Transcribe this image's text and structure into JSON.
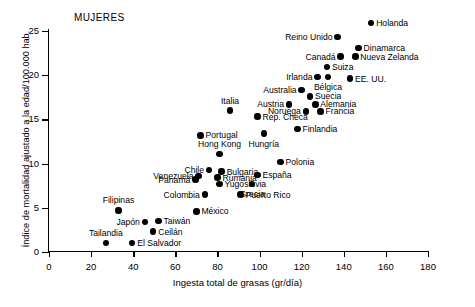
{
  "chart": {
    "title": "MUJERES",
    "xlabel": "Ingesta total de grasas (gr/día)",
    "ylabel": "Índice de mortalidad ajustado a la edad/100.000 hab."
  },
  "chart_data": {
    "type": "scatter",
    "title": "MUJERES",
    "xlabel": "Ingesta total de grasas (gr/día)",
    "ylabel": "Índice de mortalidad ajustado a la edad/100.000 hab.",
    "xlim": [
      0,
      180
    ],
    "ylim": [
      0,
      25
    ],
    "xticks": [
      0,
      20,
      40,
      60,
      80,
      100,
      120,
      140,
      160,
      180
    ],
    "yticks": [
      0,
      5,
      10,
      15,
      20,
      25
    ],
    "grid": false,
    "legend": null,
    "points": [
      {
        "label": "Holanda",
        "x": 153.0,
        "y": 25.9,
        "lpos": "r"
      },
      {
        "label": "Reino Unido",
        "x": 137.0,
        "y": 24.3,
        "lpos": "l"
      },
      {
        "label": "Dinamarca",
        "x": 147.0,
        "y": 23.1,
        "lpos": "r"
      },
      {
        "label": "Canadá",
        "x": 138.5,
        "y": 22.1,
        "lpos": "l"
      },
      {
        "label": "Nueva Zelanda",
        "x": 145.5,
        "y": 22.1,
        "lpos": "r"
      },
      {
        "label": "Suiza",
        "x": 132.0,
        "y": 20.9,
        "lpos": "r"
      },
      {
        "label": "Irlanda",
        "x": 127.5,
        "y": 19.8,
        "lpos": "l"
      },
      {
        "label": "Bélgica",
        "x": 132.5,
        "y": 19.8,
        "lpos": "b"
      },
      {
        "label": "EE. UU.",
        "x": 143.0,
        "y": 19.6,
        "lpos": "r"
      },
      {
        "label": "Australia",
        "x": 120.0,
        "y": 18.3,
        "lpos": "l"
      },
      {
        "label": "Suecia",
        "x": 124.0,
        "y": 17.6,
        "lpos": "r"
      },
      {
        "label": "Austria",
        "x": 114.0,
        "y": 16.7,
        "lpos": "l"
      },
      {
        "label": "Alemania",
        "x": 126.5,
        "y": 16.7,
        "lpos": "r"
      },
      {
        "label": "Italia",
        "x": 86.0,
        "y": 16.0,
        "lpos": "t"
      },
      {
        "label": "Noruega",
        "x": 122.0,
        "y": 15.9,
        "lpos": "l"
      },
      {
        "label": "Francia",
        "x": 129.0,
        "y": 15.9,
        "lpos": "r"
      },
      {
        "label": "Rep. Checa",
        "x": 99.0,
        "y": 15.3,
        "lpos": "r"
      },
      {
        "label": "Finlandia",
        "x": 118.0,
        "y": 13.9,
        "lpos": "r"
      },
      {
        "label": "Portugal",
        "x": 72.0,
        "y": 13.2,
        "lpos": "r"
      },
      {
        "label": "Hungría",
        "x": 102.0,
        "y": 13.4,
        "lpos": "b"
      },
      {
        "label": "Hong Kong",
        "x": 81.0,
        "y": 11.1,
        "lpos": "t"
      },
      {
        "label": "Polonia",
        "x": 110.0,
        "y": 10.2,
        "lpos": "r"
      },
      {
        "label": "Chile",
        "x": 76.0,
        "y": 9.3,
        "lpos": "l"
      },
      {
        "label": "Bulgaria",
        "x": 82.0,
        "y": 9.1,
        "lpos": "r"
      },
      {
        "label": "Venezuela",
        "x": 71.0,
        "y": 8.6,
        "lpos": "l"
      },
      {
        "label": "Rumania",
        "x": 80.0,
        "y": 8.4,
        "lpos": "r"
      },
      {
        "label": "España",
        "x": 99.0,
        "y": 8.7,
        "lpos": "r"
      },
      {
        "label": "Panamá",
        "x": 69.5,
        "y": 8.2,
        "lpos": "l"
      },
      {
        "label": "Yugoslavia",
        "x": 81.0,
        "y": 7.7,
        "lpos": "r"
      },
      {
        "label": "Grecia",
        "x": 96.5,
        "y": 7.7,
        "lpos": "b"
      },
      {
        "label": "Puerto Rico",
        "x": 91.0,
        "y": 6.5,
        "lpos": "r"
      },
      {
        "label": "Colombia",
        "x": 74.0,
        "y": 6.5,
        "lpos": "l"
      },
      {
        "label": "Filipinas",
        "x": 33.0,
        "y": 4.7,
        "lpos": "t"
      },
      {
        "label": "México",
        "x": 70.0,
        "y": 4.6,
        "lpos": "r"
      },
      {
        "label": "Taiwán",
        "x": 52.0,
        "y": 3.5,
        "lpos": "r"
      },
      {
        "label": "Japón",
        "x": 45.5,
        "y": 3.4,
        "lpos": "l"
      },
      {
        "label": "Ceilán",
        "x": 49.5,
        "y": 2.3,
        "lpos": "r"
      },
      {
        "label": "Tailandia",
        "x": 27.0,
        "y": 1.0,
        "lpos": "t"
      },
      {
        "label": "El Salvador",
        "x": 39.5,
        "y": 1.0,
        "lpos": "r"
      }
    ]
  }
}
